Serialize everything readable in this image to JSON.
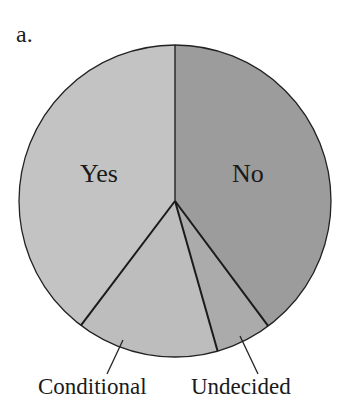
{
  "panel_label": "a.",
  "chart_data": {
    "type": "pie",
    "title": "",
    "panel_label": "a.",
    "categories": [
      "No",
      "Undecided",
      "Conditional",
      "Yes"
    ],
    "values": [
      39.8,
      5.8,
      14.7,
      39.7
    ],
    "start_angle_deg": 0,
    "direction": "clockwise",
    "colors": [
      "#9c9c9c",
      "#ababab",
      "#bdbdbd",
      "#c3c3c3"
    ],
    "labels": {
      "inside": [
        "No",
        "Yes"
      ],
      "callout": [
        "Conditional",
        "Undecided"
      ]
    }
  },
  "labels": {
    "yes": "Yes",
    "no": "No",
    "conditional": "Conditional",
    "undecided": "Undecided"
  }
}
